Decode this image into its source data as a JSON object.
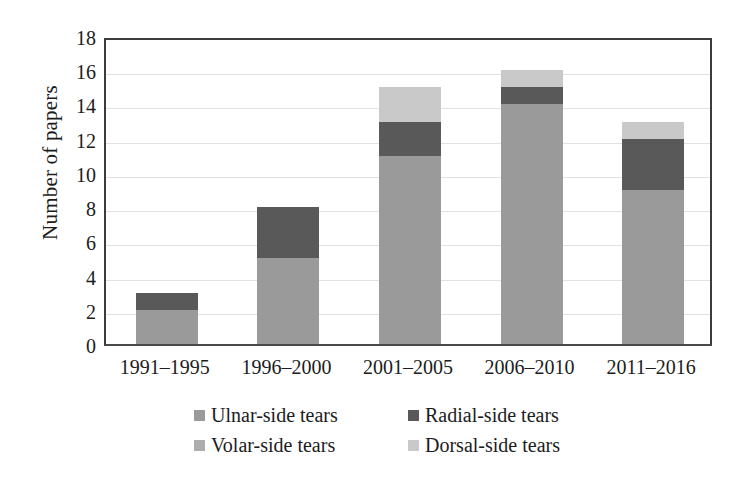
{
  "chart_data": {
    "type": "bar",
    "subtype": "stacked-bar",
    "title": "",
    "xlabel": "",
    "ylabel": "Number of papers",
    "ylim": [
      0,
      18
    ],
    "ytick_step": 2,
    "yticks": [
      18,
      16,
      14,
      12,
      10,
      8,
      6,
      4,
      2,
      0
    ],
    "grid": "horizontal",
    "legend_position": "bottom",
    "categories": [
      "1991–1995",
      "1996–2000",
      "2001–2005",
      "2006–2010",
      "2011–2016"
    ],
    "series": [
      {
        "name": "Ulnar-side tears",
        "color": "#9a9a9a",
        "values": [
          2,
          5,
          11,
          14,
          9
        ]
      },
      {
        "name": "Radial-side tears",
        "color": "#595959",
        "values": [
          1,
          3,
          2,
          1,
          3
        ]
      },
      {
        "name": "Volar-side tears",
        "color": "#adadad",
        "values": [
          0,
          0,
          0,
          0,
          0
        ]
      },
      {
        "name": "Dorsal-side tears",
        "color": "#c9c9c9",
        "values": [
          0,
          0,
          2,
          1,
          1
        ]
      }
    ],
    "totals": [
      3,
      8,
      15,
      16,
      13
    ]
  },
  "axes": {
    "y_title": "Number of papers",
    "y_tick_labels": [
      "18",
      "16",
      "14",
      "12",
      "10",
      "8",
      "6",
      "4",
      "2",
      "0"
    ],
    "x_tick_labels": [
      "1991–1995",
      "1996–2000",
      "2001–2005",
      "2006–2010",
      "2011–2016"
    ]
  },
  "legend": {
    "rows": [
      [
        {
          "label": "Ulnar-side tears",
          "color": "#9a9a9a"
        },
        {
          "label": "Radial-side tears",
          "color": "#595959"
        }
      ],
      [
        {
          "label": "Volar-side tears",
          "color": "#adadad"
        },
        {
          "label": "Dorsal-side tears",
          "color": "#c9c9c9"
        }
      ]
    ]
  }
}
